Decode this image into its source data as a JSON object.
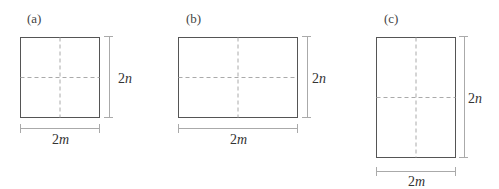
{
  "figures": [
    {
      "label": "(a)",
      "width_label_num": "2",
      "width_label_var": "m",
      "height_label_num": "2",
      "height_label_var": "n"
    },
    {
      "label": "(b)",
      "width_label_num": "2",
      "width_label_var": "m",
      "height_label_num": "2",
      "height_label_var": "n"
    },
    {
      "label": "(c)",
      "width_label_num": "2",
      "width_label_var": "m",
      "height_label_num": "2",
      "height_label_var": "n"
    }
  ],
  "colors": {
    "outline": "#555555",
    "dashed": "#aaaaaa",
    "dimension": "#aaaaaa"
  }
}
